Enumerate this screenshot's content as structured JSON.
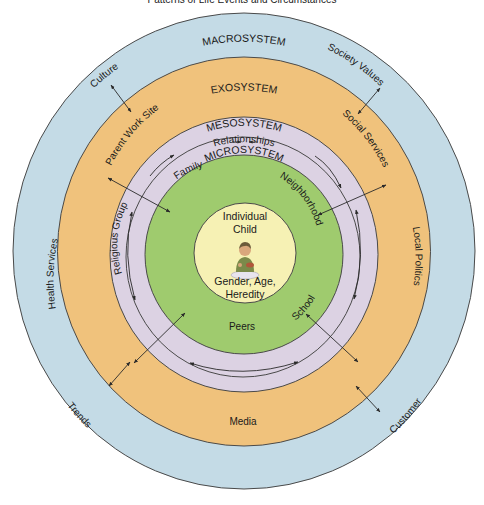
{
  "caption": "Patterns of Life Events and Circumstances",
  "colors": {
    "macrosystem": "#c4dbe6",
    "exosystem": "#f0c27c",
    "mesosystem": "#dcd2e3",
    "microsystem": "#9fcb6e",
    "individual": "#f6f1b4",
    "ring_stroke": "#4a4a4a",
    "arrow": "#2a2a2a"
  },
  "systems": {
    "macrosystem": "MACROSYSTEM",
    "exosystem": "EXOSYSTEM",
    "mesosystem": "MESOSYSTEM",
    "mesosystem_sub": "Relationships",
    "microsystem": "MICROSYSTEM"
  },
  "center": {
    "line1": "Individual",
    "line2": "Child",
    "line3": "Gender, Age,",
    "line4": "Heredity",
    "figure_icon": "child-figure"
  },
  "macrosystem_labels": {
    "culture": "Culture",
    "society_values": "Society Values",
    "trends": "Trends",
    "customer": "Customer"
  },
  "exosystem_labels": {
    "parent_work_site": "Parent Work Site",
    "social_services": "Social Services",
    "health_services": "Health Services",
    "local_politics": "Local Politics",
    "media": "Media"
  },
  "microsystem_labels": {
    "family": "Family",
    "neighborhood": "Neighborhood",
    "religious_group": "Religious Group",
    "school": "School",
    "peers": "Peers"
  }
}
